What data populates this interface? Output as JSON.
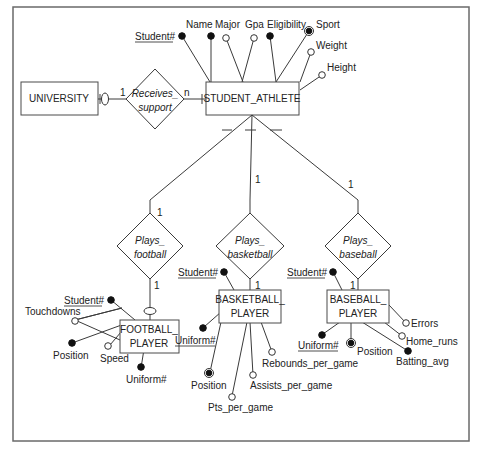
{
  "entities": {
    "university": "UNIVERSITY",
    "student_athlete": "STUDENT_ATHLETE",
    "football_player": [
      "FOOTBALL_",
      "PLAYER"
    ],
    "basketball_player": [
      "BASKETBALL_",
      "PLAYER"
    ],
    "baseball_player": [
      "BASEBALL_",
      "PLAYER"
    ]
  },
  "relationships": {
    "receives_support": [
      "Receives_",
      "support"
    ],
    "plays_football": [
      "Plays_",
      "football"
    ],
    "plays_basketball": [
      "Plays_",
      "basketball"
    ],
    "plays_baseball": [
      "Plays_",
      "baseball"
    ]
  },
  "cardinalities": {
    "university_side": "1",
    "student_athlete_side": "n",
    "football_top": "1",
    "football_bottom": "1",
    "basketball_top": "1",
    "basketball_bottom": "1",
    "baseball_top": "1",
    "baseball_bottom": "1"
  },
  "attributes": {
    "student_athlete": {
      "student_no": "Student#",
      "name": "Name",
      "major": "Major",
      "gpa": "Gpa",
      "eligibility": "Eligibility",
      "sport": "Sport",
      "weight": "Weight",
      "height": "Height"
    },
    "football_player": {
      "student_no": "Student#",
      "touchdowns": "Touchdowns",
      "position": "Position",
      "speed": "Speed",
      "uniform_no": "Uniform#"
    },
    "basketball_player": {
      "student_no": "Student#",
      "uniform_no": "Uniform#",
      "position": "Position",
      "pts_per_game": "Pts_per_game",
      "assists_per_game": "Assists_per_game",
      "rebounds_per_game": "Rebounds_per_game"
    },
    "baseball_player": {
      "student_no": "Student#",
      "uniform_no": "Uniform#",
      "position": "Position",
      "errors": "Errors",
      "home_runs": "Home_runs",
      "batting_avg": "Batting_avg"
    }
  },
  "legend_symbols": {
    "filled-circle": "required attribute",
    "open-circle": "optional attribute",
    "double-circle": "multivalued attribute"
  }
}
